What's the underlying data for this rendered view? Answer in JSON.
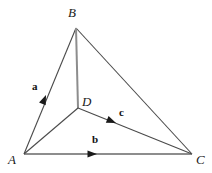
{
  "figure": {
    "kind": "geometry-vector-diagram",
    "width": 212,
    "height": 173,
    "background_color": "#ffffff"
  },
  "colors": {
    "edge_dark": "#4a4a4a",
    "edge_gray": "#8d8d8d",
    "arrow_fill": "#1a1a1a",
    "label_color": "#1a1a1a",
    "vector_label_color": "#111111"
  },
  "points": {
    "A": {
      "name": "A",
      "x": 24,
      "y": 154,
      "label_x": 8,
      "label_y": 153
    },
    "B": {
      "name": "B",
      "x": 76,
      "y": 28,
      "label_x": 68,
      "label_y": 6
    },
    "C": {
      "name": "C",
      "x": 192,
      "y": 154,
      "label_x": 196,
      "label_y": 153
    },
    "D": {
      "name": "D",
      "x": 78,
      "y": 108,
      "label_x": 82,
      "label_y": 95
    }
  },
  "edges": [
    {
      "id": "AB",
      "from": "A",
      "to": "B",
      "x1": 24,
      "y1": 154,
      "x2": 76,
      "y2": 28,
      "color": "#4a4a4a",
      "width": 1.1
    },
    {
      "id": "BC",
      "from": "B",
      "to": "C",
      "x1": 76,
      "y1": 28,
      "x2": 192,
      "y2": 154,
      "color": "#4a4a4a",
      "width": 1.1
    },
    {
      "id": "AC",
      "from": "A",
      "to": "C",
      "x1": 24,
      "y1": 154,
      "x2": 192,
      "y2": 154,
      "color": "#8d8d8d",
      "width": 2.0
    },
    {
      "id": "BD",
      "from": "B",
      "to": "D",
      "x1": 76,
      "y1": 28,
      "x2": 78,
      "y2": 108,
      "color": "#8d8d8d",
      "width": 2.0
    },
    {
      "id": "AD",
      "from": "A",
      "to": "D",
      "x1": 24,
      "y1": 154,
      "x2": 78,
      "y2": 108,
      "color": "#4a4a4a",
      "width": 1.1
    },
    {
      "id": "DC",
      "from": "D",
      "to": "C",
      "x1": 78,
      "y1": 108,
      "x2": 192,
      "y2": 154,
      "color": "#4a4a4a",
      "width": 1.1
    }
  ],
  "vectors": [
    {
      "id": "a",
      "label": "a",
      "on_edge": "AB",
      "label_x": 32,
      "label_y": 81,
      "arrow_x": 46,
      "arrow_y": 95,
      "arrow_angle_deg": -67.6
    },
    {
      "id": "b",
      "label": "b",
      "on_edge": "AC",
      "label_x": 92,
      "label_y": 134,
      "arrow_x": 97,
      "arrow_y": 154,
      "arrow_angle_deg": 0
    },
    {
      "id": "c",
      "label": "c",
      "on_edge": "DC",
      "label_x": 119,
      "label_y": 107,
      "arrow_x": 116,
      "arrow_y": 123,
      "arrow_angle_deg": 22.0
    }
  ]
}
